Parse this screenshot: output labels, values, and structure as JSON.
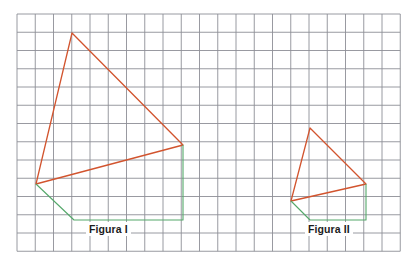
{
  "page": {
    "background_color": "#ffffff",
    "width": 418,
    "height": 273
  },
  "grid": {
    "name": "square-grid",
    "origin_x": 17,
    "origin_y": 14,
    "cell_size": 18.25,
    "columns": 21,
    "rows": 13,
    "line_color": "#8d8f96",
    "line_width": 0.9,
    "faint_line_color": "#c9cbd2"
  },
  "colors": {
    "shape_stroke": "#d2542e",
    "helper_stroke": "#54a86a",
    "grid_line": "#8d8f96",
    "label_text": "#1c1c1c"
  },
  "figures": [
    {
      "id": "figura-1",
      "label": "Figura I",
      "label_x": 86,
      "label_y": 222,
      "triangle": {
        "name": "figure-1-triangle",
        "stroke": "#d2542e",
        "points": "72,33 183,145 36,184"
      },
      "helper_path": {
        "name": "figure-1-helper-path",
        "stroke": "#54a86a",
        "points": "36,184 74,220 183,220 183,145"
      },
      "vertices": [
        {
          "name": "apex",
          "x": 72,
          "y": 33
        },
        {
          "name": "right",
          "x": 183,
          "y": 145
        },
        {
          "name": "left",
          "x": 36,
          "y": 184
        }
      ],
      "helper_vertices": [
        {
          "name": "left",
          "x": 36,
          "y": 184
        },
        {
          "name": "bottom-left",
          "x": 74,
          "y": 220
        },
        {
          "name": "bottom-right",
          "x": 183,
          "y": 220
        },
        {
          "name": "right",
          "x": 183,
          "y": 145
        }
      ]
    },
    {
      "id": "figura-2",
      "label": "Figura II",
      "label_x": 305,
      "label_y": 222,
      "triangle": {
        "name": "figure-2-triangle",
        "stroke": "#d2542e",
        "points": "310,128 366,184 291,201"
      },
      "helper_path": {
        "name": "figure-2-helper-path",
        "stroke": "#54a86a",
        "points": "291,201 310,220 366,220 366,184"
      },
      "vertices": [
        {
          "name": "apex",
          "x": 310,
          "y": 128
        },
        {
          "name": "right",
          "x": 366,
          "y": 184
        },
        {
          "name": "left",
          "x": 291,
          "y": 201
        }
      ],
      "helper_vertices": [
        {
          "name": "left",
          "x": 291,
          "y": 201
        },
        {
          "name": "bottom-left",
          "x": 310,
          "y": 220
        },
        {
          "name": "bottom-right",
          "x": 366,
          "y": 220
        },
        {
          "name": "right",
          "x": 366,
          "y": 184
        }
      ]
    }
  ]
}
